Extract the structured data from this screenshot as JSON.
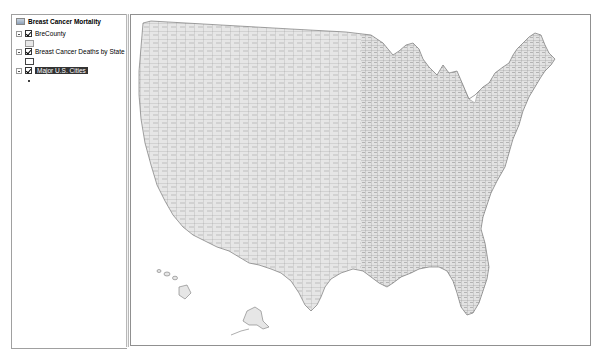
{
  "toc": {
    "data_frame": {
      "label": "Breast Cancer Mortality",
      "icon": "layers-icon"
    },
    "layers": [
      {
        "label": "BreCounty",
        "checked": true,
        "expanded": true,
        "symbol": "fill-swatch",
        "symbol_fill": "#e8e8e8",
        "symbol_outline": "#9a9a9a"
      },
      {
        "label": "Breast Cancer Deaths by State",
        "checked": true,
        "expanded": true,
        "symbol": "hollow-swatch",
        "symbol_fill": "#ffffff",
        "symbol_outline": "#444444"
      },
      {
        "label": "Major U.S. Cities",
        "checked": true,
        "expanded": true,
        "selected": true,
        "symbol": "point-dot",
        "symbol_fill": "#000000"
      }
    ]
  },
  "map": {
    "description": "U.S. county map (contiguous states with Alaska and Hawaii insets)",
    "county_fill": "#e6e6e6",
    "county_outline": "#7a7a7a",
    "background": "#ffffff"
  }
}
